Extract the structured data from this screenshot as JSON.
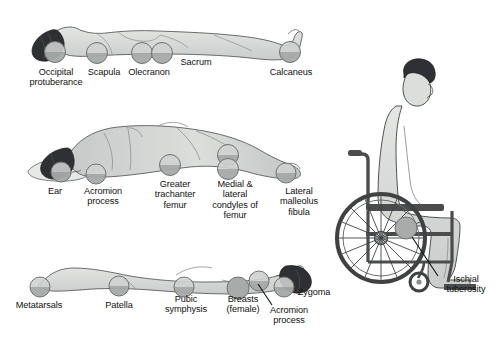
{
  "figure": {
    "background_color": "#ffffff",
    "ink_color": "#111111",
    "skin_fill": "#d9dbd9",
    "skin_shade": "#c3c6c4",
    "hair_color": "#2f3033",
    "pressure_circle_fill": "#b9bcbb",
    "pressure_circle_stroke": "#6f7272",
    "wheelchair_frame_color": "#4a4c4d"
  },
  "panels": [
    {
      "id": "supine",
      "name": "supine-position",
      "position_label": "Supine (lying on back)",
      "labels": [
        {
          "name": "occipital-protuberance",
          "text": "Occipital\nprotuberance",
          "x": 16,
          "y": 67,
          "w": 80
        },
        {
          "name": "scapula",
          "text": "Scapula",
          "x": 76,
          "y": 67,
          "w": 56
        },
        {
          "name": "olecranon",
          "text": "Olecranon",
          "x": 118,
          "y": 67,
          "w": 62
        },
        {
          "name": "sacrum",
          "text": "Sacrum",
          "x": 168,
          "y": 57,
          "w": 56
        },
        {
          "name": "calcaneus",
          "text": "Calcaneus",
          "x": 260,
          "y": 67,
          "w": 62
        }
      ],
      "points": [
        {
          "name": "point-occipital-protuberance",
          "cx": 55,
          "cy": 52
        },
        {
          "name": "point-scapula",
          "cx": 97,
          "cy": 53
        },
        {
          "name": "point-olecranon",
          "cx": 142,
          "cy": 53
        },
        {
          "name": "point-sacrum",
          "cx": 162,
          "cy": 53
        },
        {
          "name": "point-calcaneus",
          "cx": 290,
          "cy": 52
        }
      ]
    },
    {
      "id": "lateral",
      "name": "lateral-position",
      "position_label": "Lateral (side-lying)",
      "labels": [
        {
          "name": "ear",
          "text": "Ear",
          "x": 38,
          "y": 186,
          "w": 34
        },
        {
          "name": "acromion-process",
          "text": "Acromion\nprocess",
          "x": 72,
          "y": 186,
          "w": 62
        },
        {
          "name": "greater-trachanter-femur",
          "text": "Greater\ntrachanter\nfemur",
          "x": 144,
          "y": 179,
          "w": 62
        },
        {
          "name": "medial-lateral-condyles-femur",
          "text": "Medial &\nlateral\ncondyles of\nfemur",
          "x": 202,
          "y": 179,
          "w": 66
        },
        {
          "name": "lateral-malleolus-fibula",
          "text": "Lateral\nmalleolus\nfibula",
          "x": 268,
          "y": 186,
          "w": 62
        }
      ],
      "points": [
        {
          "name": "point-ear",
          "cx": 61,
          "cy": 172
        },
        {
          "name": "point-acromion-process",
          "cx": 96,
          "cy": 174
        },
        {
          "name": "point-greater-trachanter",
          "cx": 170,
          "cy": 165
        },
        {
          "name": "point-medial-condyle",
          "cx": 228,
          "cy": 155
        },
        {
          "name": "point-lateral-condyle",
          "cx": 228,
          "cy": 169
        },
        {
          "name": "point-lateral-malleolus",
          "cx": 286,
          "cy": 173
        }
      ]
    },
    {
      "id": "prone",
      "name": "prone-position",
      "position_label": "Prone (lying face down)",
      "labels": [
        {
          "name": "metatarsals",
          "text": "Metatarsals",
          "x": 8,
          "y": 300,
          "w": 62
        },
        {
          "name": "patella",
          "text": "Patella",
          "x": 94,
          "y": 300,
          "w": 50
        },
        {
          "name": "pubic-symphysis",
          "text": "Pubic\nsymphysis",
          "x": 155,
          "y": 294,
          "w": 62
        },
        {
          "name": "breasts-female",
          "text": "Breasts\n(female)",
          "x": 216,
          "y": 294,
          "w": 54
        },
        {
          "name": "acromion-process-prone",
          "text": "Acromion\nprocess",
          "x": 258,
          "y": 305,
          "w": 62
        },
        {
          "name": "zygoma",
          "text": "Zygoma",
          "x": 288,
          "y": 287,
          "w": 52
        }
      ],
      "points": [
        {
          "name": "point-metatarsals",
          "cx": 40,
          "cy": 287
        },
        {
          "name": "point-patella",
          "cx": 119,
          "cy": 286
        },
        {
          "name": "point-pubic-symphysis",
          "cx": 184,
          "cy": 287
        },
        {
          "name": "point-breasts",
          "cx": 238,
          "cy": 288
        },
        {
          "name": "point-acromion-prone",
          "cx": 259,
          "cy": 281
        },
        {
          "name": "point-zygoma",
          "cx": 284,
          "cy": 287
        }
      ]
    },
    {
      "id": "sitting",
      "name": "sitting-wheelchair-position",
      "position_label": "Sitting in wheelchair",
      "labels": [
        {
          "name": "ischial-tuberosity",
          "text": "Ischial\ntuberosity",
          "x": 434,
          "y": 274,
          "w": 64
        }
      ],
      "points": [
        {
          "name": "point-ischial-tuberosity",
          "cx": 406,
          "cy": 228
        }
      ]
    }
  ]
}
